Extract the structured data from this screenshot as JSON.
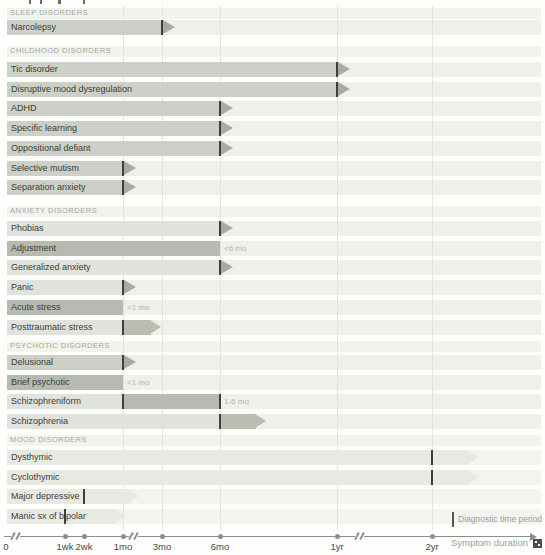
{
  "colors": {
    "track": "#eef0ea",
    "mood_track": "#f3f4ef",
    "header_band": "#f1f3ee",
    "bar_mid": "#ccd0c6",
    "bar_light": "#e0e3db",
    "bar_dark": "#b6bab0",
    "bar_mood": "#e8eae2",
    "arrow_head": "#a7aca2",
    "arrow_bar": "#b9bdb2",
    "marker": "#3d403b",
    "gridline": "#e2e4dd",
    "axis": "#8b8f89",
    "row_text": "#3b3e39",
    "header_text": "#a3a8a0",
    "note_text": "#b0b5ad",
    "tick_text": "#45483f",
    "muted_text": "#9a9e97",
    "watermark": "#4a4f49"
  },
  "legend": {
    "diagnostic_label": "Diagnostic time period"
  },
  "axis": {
    "title": "Symptom duration",
    "origin_label": "0",
    "ticks": [
      "1wk",
      "2wk",
      "1mo",
      "3mo",
      "6mo",
      "1yr",
      "2yr"
    ]
  },
  "chart_data": {
    "type": "bar",
    "orientation": "horizontal-timeline",
    "x_axis": {
      "label": "Symptom duration",
      "scale": "broken-nonlinear",
      "ticks": [
        "0",
        "1wk",
        "2wk",
        "1mo",
        "3mo",
        "6mo",
        "1yr",
        "2yr"
      ],
      "breaks_after": [
        "0",
        "1mo",
        "1yr"
      ]
    },
    "legend": "Diagnostic time period",
    "sections": [
      {
        "header": "SLEEP DISORDERS",
        "rows": [
          {
            "label": "Narcolepsy",
            "shade": "mid",
            "end": "3mo",
            "marker": true,
            "arrow": "head"
          }
        ]
      },
      {
        "header": "CHILDHOOD DISORDERS",
        "rows": [
          {
            "label": "Tic disorder",
            "shade": "mid",
            "end": "1yr",
            "marker": true,
            "arrow": "head"
          },
          {
            "label": "Disruptive mood dysregulation",
            "shade": "mid",
            "end": "1yr",
            "marker": true,
            "arrow": "head"
          },
          {
            "label": "ADHD",
            "shade": "mid",
            "end": "6mo",
            "marker": true,
            "arrow": "head"
          },
          {
            "label": "Specific learning",
            "shade": "mid",
            "end": "6mo",
            "marker": true,
            "arrow": "head"
          },
          {
            "label": "Oppositional defiant",
            "shade": "mid",
            "end": "6mo",
            "marker": true,
            "arrow": "head"
          },
          {
            "label": "Selective mutism",
            "shade": "mid",
            "end": "1mo",
            "marker": true,
            "arrow": "head"
          },
          {
            "label": "Separation anxiety",
            "shade": "mid",
            "end": "1mo",
            "marker": true,
            "arrow": "head"
          }
        ]
      },
      {
        "header": "ANXIETY DISORDERS",
        "rows": [
          {
            "label": "Phobias",
            "shade": "light",
            "end": "6mo",
            "marker": true,
            "arrow": "head"
          },
          {
            "label": "Adjustment",
            "shade": "dark",
            "end": "6mo",
            "marker": false,
            "arrow": "none",
            "note": "<6 mo"
          },
          {
            "label": "Generalized anxiety",
            "shade": "light",
            "end": "6mo",
            "marker": true,
            "arrow": "head"
          },
          {
            "label": "Panic",
            "shade": "light",
            "end": "1mo",
            "marker": true,
            "arrow": "head"
          },
          {
            "label": "Acute stress",
            "shade": "dark",
            "end": "1mo",
            "marker": false,
            "arrow": "none",
            "note": "<1 mo"
          },
          {
            "label": "Posttraumatic stress",
            "shade": "light",
            "end": "1mo",
            "marker": true,
            "arrow": "bar",
            "arrow_to_px": 161
          }
        ]
      },
      {
        "header": "PSYCHOTIC DISORDERS",
        "rows": [
          {
            "label": "Delusional",
            "shade": "mid",
            "end": "1mo",
            "marker": true,
            "arrow": "head"
          },
          {
            "label": "Brief psychotic",
            "shade": "dark",
            "end": "1mo",
            "marker": false,
            "arrow": "none",
            "note": "<1 mo"
          },
          {
            "label": "Schizophreniform",
            "shade": "light",
            "end": "1mo",
            "marker": true,
            "arrow": "none",
            "segment2": {
              "to": "6mo",
              "shade": "dark",
              "marker": true
            },
            "note": "1-6 mo"
          },
          {
            "label": "Schizophrenia",
            "shade": "light",
            "end": "6mo",
            "marker": true,
            "arrow": "bar",
            "arrow_to_px": 266
          }
        ]
      },
      {
        "header": "MOOD DISORDERS",
        "rows": [
          {
            "label": "Dysthymic",
            "shade": "mood",
            "end": "2yr",
            "marker": true,
            "arrow": "moodbar",
            "arrow_to_px": 479
          },
          {
            "label": "Cyclothymic",
            "shade": "mood",
            "end": "2yr",
            "marker": true,
            "arrow": "moodbar",
            "arrow_to_px": 479
          },
          {
            "label": "Major depressive",
            "shade": "mood",
            "end": "2wk",
            "marker": true,
            "arrow": "moodbar",
            "arrow_to_px": 139
          },
          {
            "label": "Manic sx of bipolar",
            "shade": "mood",
            "end": "1wk",
            "marker": true,
            "arrow": "moodbar",
            "arrow_to_px": 126
          }
        ]
      }
    ]
  }
}
